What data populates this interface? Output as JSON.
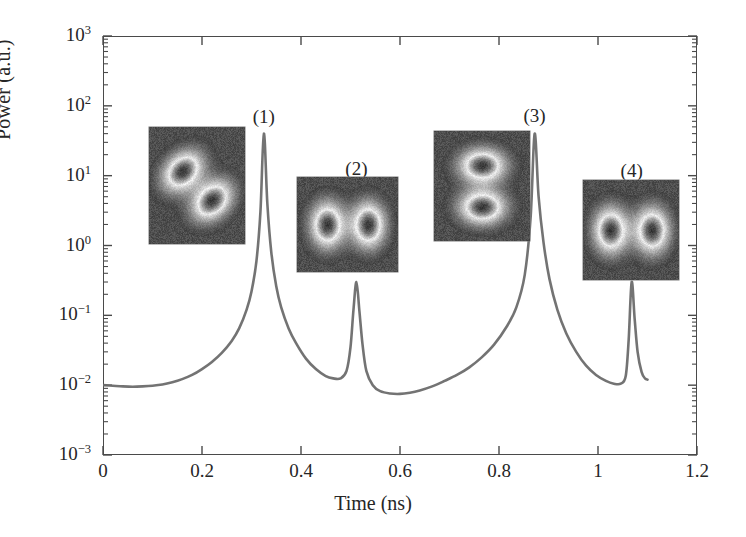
{
  "figure": {
    "title": "",
    "background": "#ffffff",
    "trace_color": "#6b6b6b",
    "axis_color": "#4a4a4a"
  },
  "axes": {
    "xlabel": "Time (ns)",
    "ylabel": "Power (a.u.)",
    "xticks": [
      "0",
      "0.2",
      "0.4",
      "0.6",
      "0.8",
      "1",
      "1.2"
    ],
    "xtick_values": [
      0,
      0.2,
      0.4,
      0.6,
      0.8,
      1.0,
      1.2
    ],
    "ytick_labels": [
      "10",
      "10",
      "10",
      "10",
      "10",
      "10",
      "10"
    ],
    "ytick_exponents": [
      "3",
      "2",
      "1",
      "0",
      "−1",
      "−2",
      "−3"
    ],
    "ytick_values": [
      1000,
      100,
      10,
      1,
      0.1,
      0.01,
      0.001
    ]
  },
  "peak_labels": [
    {
      "text": "(1)",
      "x": 0.325,
      "y_px": 106
    },
    {
      "text": "(2)",
      "x": 0.512,
      "y_px": 158
    },
    {
      "text": "(3)",
      "x": 0.872,
      "y_px": 105
    },
    {
      "text": "(4)",
      "x": 1.068,
      "y_px": 160
    }
  ],
  "insets": [
    {
      "name": "beam-profile-1",
      "mode": "diagonal-two-lobe",
      "left": 149,
      "top": 127,
      "width": 96,
      "height": 117,
      "angle": 45
    },
    {
      "name": "beam-profile-2",
      "mode": "horizontal-two-lobe",
      "left": 297,
      "top": 177,
      "width": 101,
      "height": 95,
      "angle": 0
    },
    {
      "name": "beam-profile-3",
      "mode": "vertical-two-lobe",
      "left": 434,
      "top": 131,
      "width": 96,
      "height": 110,
      "angle": 90
    },
    {
      "name": "beam-profile-4",
      "mode": "horizontal-two-lobe",
      "left": 583,
      "top": 180,
      "width": 96,
      "height": 100,
      "angle": 0
    }
  ],
  "chart_data": {
    "type": "line",
    "title": "",
    "xlabel": "Time (ns)",
    "ylabel": "Power (a.u.)",
    "yscale": "log",
    "xlim": [
      0,
      1.2
    ],
    "ylim": [
      0.001,
      1000
    ],
    "grid": false,
    "legend": null,
    "series": [
      {
        "name": "Power",
        "color": "#6b6b6b",
        "description": "Mode-beating pulse train: four peaks at 0.325, 0.512, 0.872 and 1.068 ns with alternating large (~40 a.u.) and small (~0.3 a.u.) amplitudes on a ~0.01 a.u. baseline",
        "peaks": [
          {
            "label": "(1)",
            "time_ns": 0.325,
            "power": 40.0
          },
          {
            "label": "(2)",
            "time_ns": 0.512,
            "power": 0.3
          },
          {
            "label": "(3)",
            "time_ns": 0.872,
            "power": 40.0
          },
          {
            "label": "(4)",
            "time_ns": 1.068,
            "power": 0.3
          }
        ],
        "baseline": 0.0095,
        "x": [
          0.0,
          0.02,
          0.04,
          0.06,
          0.08,
          0.1,
          0.12,
          0.14,
          0.16,
          0.18,
          0.2,
          0.22,
          0.24,
          0.26,
          0.275,
          0.29,
          0.3,
          0.31,
          0.318,
          0.325,
          0.332,
          0.34,
          0.35,
          0.36,
          0.375,
          0.39,
          0.41,
          0.43,
          0.45,
          0.465,
          0.48,
          0.492,
          0.5,
          0.506,
          0.512,
          0.518,
          0.524,
          0.532,
          0.545,
          0.56,
          0.58,
          0.6,
          0.62,
          0.64,
          0.665,
          0.69,
          0.715,
          0.74,
          0.765,
          0.79,
          0.815,
          0.835,
          0.852,
          0.864,
          0.872,
          0.88,
          0.89,
          0.902,
          0.918,
          0.936,
          0.956,
          0.976,
          0.996,
          1.016,
          1.032,
          1.046,
          1.056,
          1.062,
          1.068,
          1.074,
          1.08,
          1.088,
          1.095,
          1.1
        ],
        "y": [
          0.01,
          0.0098,
          0.0096,
          0.0095,
          0.0096,
          0.0098,
          0.0102,
          0.011,
          0.0122,
          0.014,
          0.017,
          0.0215,
          0.029,
          0.043,
          0.065,
          0.12,
          0.22,
          0.6,
          3.0,
          40.0,
          4.0,
          0.8,
          0.26,
          0.13,
          0.065,
          0.04,
          0.024,
          0.017,
          0.0135,
          0.0125,
          0.0125,
          0.016,
          0.035,
          0.12,
          0.3,
          0.115,
          0.04,
          0.016,
          0.01,
          0.0082,
          0.0076,
          0.0075,
          0.0078,
          0.0084,
          0.0096,
          0.0115,
          0.014,
          0.018,
          0.025,
          0.038,
          0.068,
          0.13,
          0.38,
          2.6,
          40.0,
          5.0,
          1.1,
          0.33,
          0.12,
          0.055,
          0.03,
          0.019,
          0.014,
          0.0115,
          0.0105,
          0.0105,
          0.0135,
          0.045,
          0.3,
          0.09,
          0.03,
          0.0155,
          0.0125,
          0.012
        ]
      }
    ]
  }
}
